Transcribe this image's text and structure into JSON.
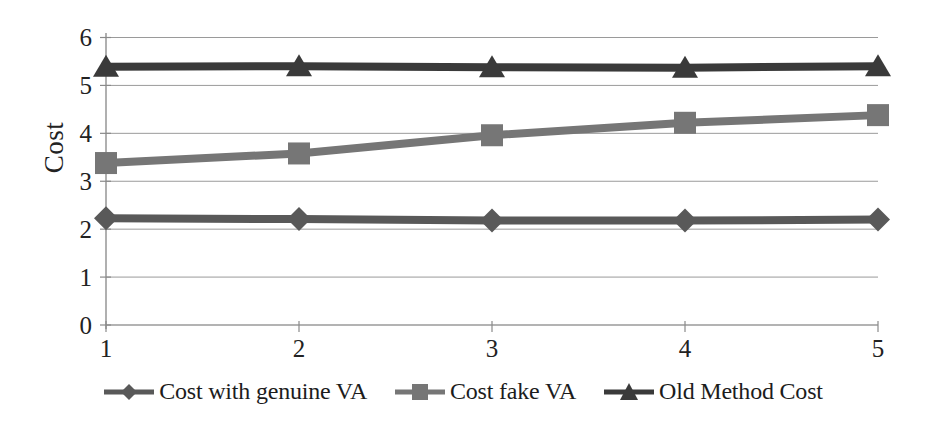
{
  "chart_data": {
    "type": "line",
    "title": "",
    "xlabel": "",
    "ylabel": "Cost",
    "x": [
      1,
      2,
      3,
      4,
      5
    ],
    "categories": [
      "1",
      "2",
      "3",
      "4",
      "5"
    ],
    "xtick_labels": [
      "1",
      "2",
      "3",
      "4",
      "5"
    ],
    "ytick_labels": [
      "0",
      "1",
      "2",
      "3",
      "4",
      "5",
      "6"
    ],
    "yticks": [
      0,
      1,
      2,
      3,
      4,
      5,
      6
    ],
    "ylim": [
      0,
      6
    ],
    "xlim": [
      1,
      5
    ],
    "grid": true,
    "grid_axis": "y",
    "legend_position": "bottom",
    "series": [
      {
        "name": "Cost with genuine VA",
        "marker": "diamond",
        "color": "#595959",
        "values": [
          2.23,
          2.21,
          2.18,
          2.18,
          2.2
        ]
      },
      {
        "name": "Cost fake VA",
        "marker": "square",
        "color": "#767676",
        "values": [
          3.38,
          3.58,
          3.96,
          4.22,
          4.38
        ]
      },
      {
        "name": "Old Method Cost",
        "marker": "triangle",
        "color": "#3a3a3a",
        "values": [
          5.39,
          5.4,
          5.38,
          5.37,
          5.4
        ]
      }
    ]
  },
  "legend": {
    "items": [
      {
        "label": "Cost with genuine VA",
        "marker": "diamond-marker-icon"
      },
      {
        "label": "Cost fake VA",
        "marker": "square-marker-icon"
      },
      {
        "label": "Old Method Cost",
        "marker": "triangle-marker-icon"
      }
    ]
  },
  "axes": {
    "y_label": "Cost",
    "y_ticks": [
      "6",
      "5",
      "4",
      "3",
      "2",
      "1",
      "0"
    ],
    "x_ticks": [
      "1",
      "2",
      "3",
      "4",
      "5"
    ]
  },
  "colors": {
    "series_1": "#595959",
    "series_2": "#767676",
    "series_3": "#3a3a3a",
    "grid": "#9a9a9a",
    "axis": "#8a8a8a",
    "text": "#222222",
    "background": "#ffffff"
  }
}
